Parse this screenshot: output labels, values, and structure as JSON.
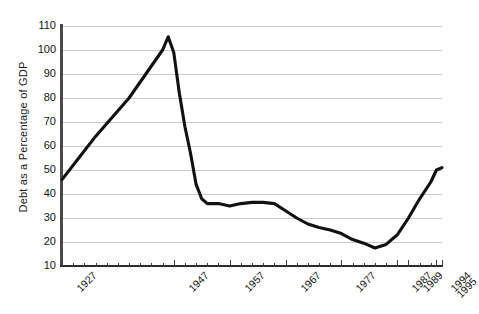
{
  "chart_data": {
    "type": "line",
    "title": "",
    "xlabel": "",
    "ylabel": "Debt as a Percentage of GDP",
    "xlim": [
      1927,
      1995
    ],
    "ylim": [
      10,
      110
    ],
    "ytick_values": [
      10,
      20,
      30,
      40,
      50,
      60,
      70,
      80,
      90,
      100,
      110
    ],
    "ytick_labels": [
      "10",
      "20",
      "30",
      "40",
      "50",
      "60",
      "70",
      "80",
      "90",
      "100",
      "110"
    ],
    "xtick_labels": [
      "1927",
      "1947",
      "1957",
      "1967",
      "1977",
      "1987",
      "1989",
      "1994",
      "1995"
    ],
    "xtick_values": [
      1927,
      1947,
      1957,
      1967,
      1977,
      1987,
      1989,
      1994,
      1995
    ],
    "xtick_minor_step": 2,
    "grid": "horizontal",
    "legend": "none",
    "line_color": "#111111",
    "grid_color": "#c9c9c9",
    "x": [
      1927,
      1930,
      1933,
      1936,
      1939,
      1942,
      1945,
      1946,
      1947,
      1948,
      1949,
      1950,
      1951,
      1952,
      1953,
      1955,
      1957,
      1959,
      1961,
      1963,
      1965,
      1967,
      1969,
      1971,
      1973,
      1975,
      1977,
      1979,
      1981,
      1983,
      1985,
      1987,
      1989,
      1991,
      1993,
      1994,
      1995
    ],
    "values": [
      46,
      55,
      64,
      72,
      80,
      90,
      100,
      105.5,
      99,
      82,
      68,
      57,
      44,
      38,
      36,
      36,
      35,
      36,
      36.5,
      36.5,
      36,
      33,
      30,
      27.5,
      26,
      25,
      23.5,
      21,
      19.5,
      17.5,
      19,
      23,
      30,
      38,
      45,
      50,
      51
    ]
  },
  "axis": {
    "yaxis_title": "Debt as a Percentage of GDP"
  }
}
